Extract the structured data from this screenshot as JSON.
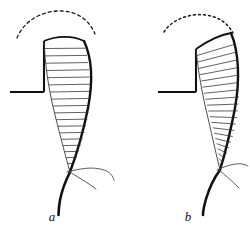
{
  "figure": {
    "background_color": "#ffffff",
    "ink_color": "#111111",
    "hatch_color": "#2b2b2b",
    "thin_color": "#4a4a4a",
    "width": 250,
    "height": 232,
    "caption_style": "italic-serif",
    "panel_count": 2
  },
  "panels": [
    {
      "id": "a",
      "label": "a",
      "label_x": 52,
      "label_y": 221,
      "trajectory": {
        "style": "dashed",
        "dash_pattern": "3 3",
        "description": "dashed arc sweeping from upper-left down to apex of body"
      },
      "baseline": {
        "description": "horizontal ground line meeting vertical stem",
        "horizontal_y": 92,
        "horizontal_x_start": 10,
        "horizontal_x_end": 44,
        "vertical_x": 44,
        "vertical_y_top": 40,
        "vertical_y_bottom": 92
      },
      "body": {
        "description": "tapering curved blade with ladder hatching",
        "segment_count": 19,
        "apex_y": 38,
        "tip_y": 178
      },
      "tail": {
        "description": "thick curved tail descending from tip"
      },
      "whisker": {
        "description": "thin hair-like arc branching right from tip"
      }
    },
    {
      "id": "b",
      "label": "b",
      "label_x": 188,
      "label_y": 221,
      "trajectory": {
        "style": "dotted",
        "dash_pattern": "2 3",
        "description": "dotted arc flatter and wider than panel a"
      },
      "baseline": {
        "description": "horizontal ground line meeting vertical stem",
        "horizontal_y": 92,
        "horizontal_x_start": 158,
        "horizontal_x_end": 196,
        "vertical_x": 196,
        "vertical_y_top": 48,
        "vertical_y_bottom": 92
      },
      "body": {
        "description": "tapering curved blade with ladder hatching, tilted apex",
        "segment_count": 20,
        "apex_y": 34,
        "tip_y": 172
      },
      "tail": {
        "description": "thick curved tail descending from tip"
      },
      "whisker": {
        "description": "thin hair-like arc branching right from tip"
      }
    }
  ]
}
